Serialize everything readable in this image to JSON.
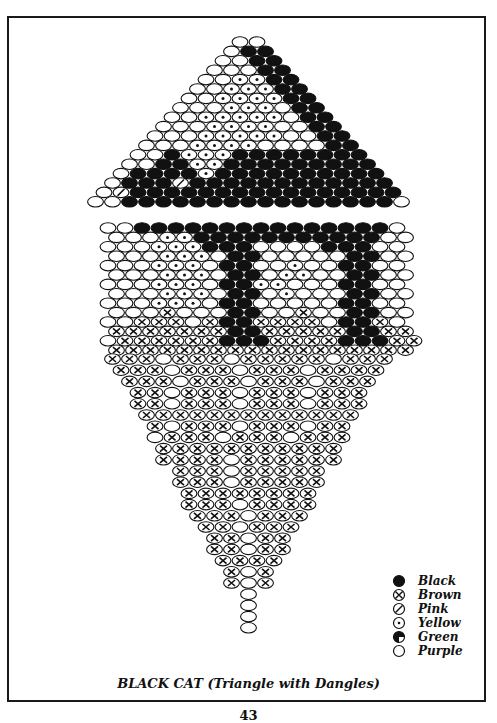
{
  "caption": "BLACK CAT (Triangle with Dangles)",
  "page_number": "43",
  "colors": {
    "ink": "#111111",
    "paper": "#ffffff"
  },
  "legend": [
    {
      "code": "K",
      "label": "Black",
      "symbol": "filled-circle"
    },
    {
      "code": "B",
      "label": "Brown",
      "symbol": "circle-x"
    },
    {
      "code": "P",
      "label": "Pink",
      "symbol": "circle-slash"
    },
    {
      "code": "Y",
      "label": "Yellow",
      "symbol": "circle-dot"
    },
    {
      "code": "G",
      "label": "Green",
      "symbol": "circle-half-fill"
    },
    {
      "code": "O",
      "label": "Purple",
      "symbol": "open-circle"
    }
  ],
  "bead": {
    "w": 17,
    "h": 10.5,
    "pitch": 9.4
  },
  "triangle": {
    "center_x": 248.5,
    "top_y": 42,
    "rows": [
      "OO",
      "OKK",
      "OOKK",
      "OOOKK",
      "OOYYKK",
      "OOYYYKK",
      "OOYYYYKK",
      "OOOYYYOKK",
      "OOYYYYYOKK",
      "OOOYYYYOOKK",
      "OOOYYYYYOOKK",
      "OOOYYYYOOOOKK",
      "OOKYYYKKKKKKKK",
      "OOKKYYKKKKKKKKK",
      "OKKKKYKKKKKKKKKK",
      "OKKKPKKKKKKKKKKKK",
      "OPKKKKKKKKKKKKKKKK",
      "OOKKKKKKKKKKKKKKKKO"
    ]
  },
  "body": {
    "left_x": 108,
    "top_y": 228,
    "rows": [
      "OOKKKKKKKKKKKKKKKO",
      "OOOYYKKKKKKKKKKKOO",
      "OOOYYYKKKOOOOKKKOO",
      "OOOYYYOKKOOOOOKKOO",
      "OOOYYYOKKOOYOOKKOO",
      "OOOYYYOKKOYYOOKKOO",
      "OOOYYYOKKYYOOOKKOO",
      "OOOYYYOKKOYOOOKKOO",
      "OOOYYYOKKOOOOOKKOO",
      "OOOBOOOKKOOBOOKKOO",
      "OOBBBOBKKBBBBOKKBO",
      "BBBBBBBKKBBBBBKKBB",
      "OBBBBBBKKKBBBBKKKBB",
      "BBBBBBBBBBBBBBBBBB"
    ]
  },
  "dangles": {
    "center_x": 248.5,
    "top_y": 359,
    "rows": [
      "BBBOBBBOBBBBBOBBB",
      "BBBOBBBOBBBOBBBB",
      "BBBOBBBOBBBOBBB",
      "BBOBBBOBBBOBBB",
      "BBOBBBOBBBOBBB",
      "BBBBBBBBBBBBB",
      "BOBBBOBBBOBB",
      "OBBBOBBBOBBB",
      "BBBBBBBBBBB",
      "BBBBOBBBBBB",
      "BBBOBBBBB",
      "BBBOBBBBB",
      "BBBBBBBB",
      "BBBOBBBB",
      "BBBOBBB",
      "BBOBBB",
      "BBOBB",
      "BBOBB",
      "BBBB",
      "BOB",
      "BOB",
      "O",
      "O",
      "O",
      "O"
    ]
  }
}
